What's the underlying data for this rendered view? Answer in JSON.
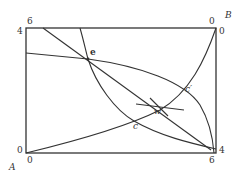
{
  "diagram": {
    "type": "edgeworth-box",
    "origins": {
      "bottom_left": "A",
      "top_right": "B"
    },
    "axis_labels": {
      "top_left_x": "6",
      "top_left_y": "4",
      "top_right_x": "0",
      "top_right_y": "0",
      "bottom_left_y": "0",
      "bottom_left_x": "0",
      "bottom_right_y": "4",
      "bottom_right_x": "6"
    },
    "points": {
      "e": "e",
      "c_prime": "c′",
      "w": "w",
      "c": "c"
    },
    "colors": {
      "line": "#333333",
      "background": "#ffffff"
    }
  }
}
